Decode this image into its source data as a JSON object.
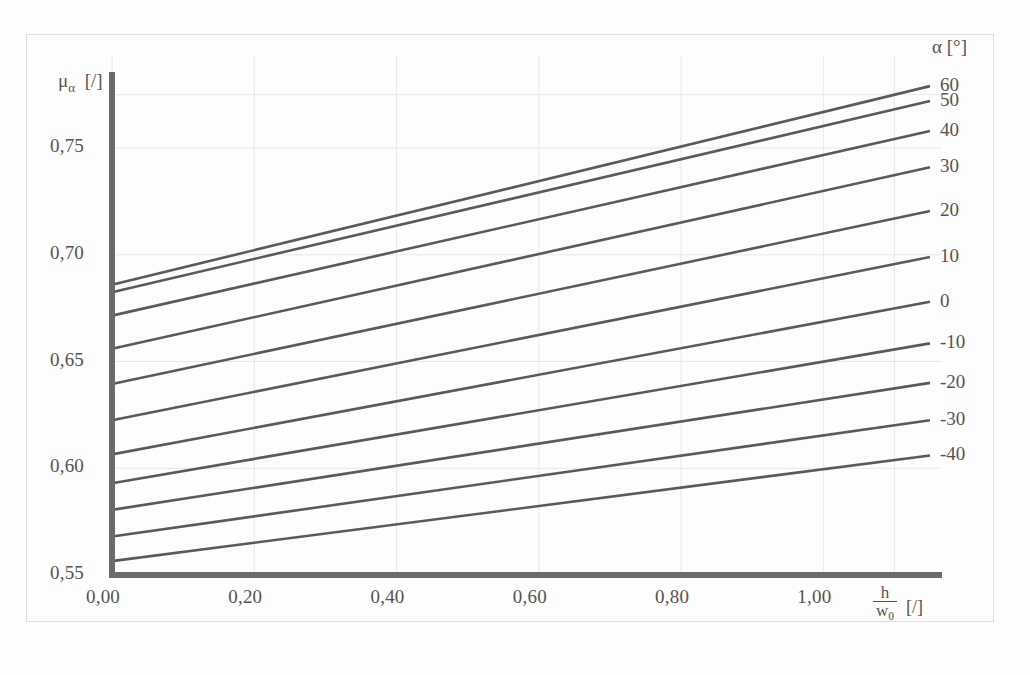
{
  "figure": {
    "background_color": "#fdfdfd",
    "line_color": "#5a5a5a",
    "axis_color": "#6b6b6b",
    "grid_color": "#e8e8ec",
    "text_color": "#555353"
  },
  "axes": {
    "y_axis_title_mu": "μ",
    "y_axis_title_sub": "α",
    "y_axis_title_unit": "[/]",
    "x_axis_title_num": "h",
    "x_axis_title_den": "w",
    "x_axis_title_den_sub": "0",
    "x_axis_title_unit": "[/]",
    "x_tick_labels": [
      "0,00",
      "0,20",
      "0,40",
      "0,60",
      "0,80",
      "1,00"
    ],
    "y_tick_labels": [
      "0,75",
      "0,70",
      "0,65",
      "0,60",
      "0,55"
    ]
  },
  "legend": {
    "header_symbol": "α",
    "header_unit": "[°]",
    "header": "α [°]",
    "entries": [
      "60",
      "50",
      "40",
      "30",
      "20",
      "10",
      "0",
      "-10",
      "-20",
      "-30",
      "-40"
    ]
  },
  "chart_data": {
    "type": "line",
    "title": "",
    "xlabel": "h/w0 [/]",
    "ylabel": "mu_alpha [/]",
    "xlim": [
      0.0,
      1.15
    ],
    "ylim": [
      0.55,
      0.78
    ],
    "xticks": [
      0.0,
      0.2,
      0.4,
      0.6,
      0.8,
      1.0
    ],
    "yticks": [
      0.55,
      0.6,
      0.65,
      0.7,
      0.75
    ],
    "grid": true,
    "legend_position": "right",
    "legend_title": "α [°]",
    "x": [
      0.0,
      1.15
    ],
    "series": [
      {
        "name": "60",
        "values": [
          0.686,
          0.779
        ]
      },
      {
        "name": "50",
        "values": [
          0.6825,
          0.772
        ]
      },
      {
        "name": "40",
        "values": [
          0.6715,
          0.758
        ]
      },
      {
        "name": "30",
        "values": [
          0.656,
          0.741
        ]
      },
      {
        "name": "20",
        "values": [
          0.6395,
          0.7205
        ]
      },
      {
        "name": "10",
        "values": [
          0.6225,
          0.699
        ]
      },
      {
        "name": "0",
        "values": [
          0.6065,
          0.678
        ]
      },
      {
        "name": "-10",
        "values": [
          0.593,
          0.6585
        ]
      },
      {
        "name": "-20",
        "values": [
          0.5805,
          0.64
        ]
      },
      {
        "name": "-30",
        "values": [
          0.568,
          0.6225
        ]
      },
      {
        "name": "-40",
        "values": [
          0.5565,
          0.606
        ]
      }
    ]
  }
}
